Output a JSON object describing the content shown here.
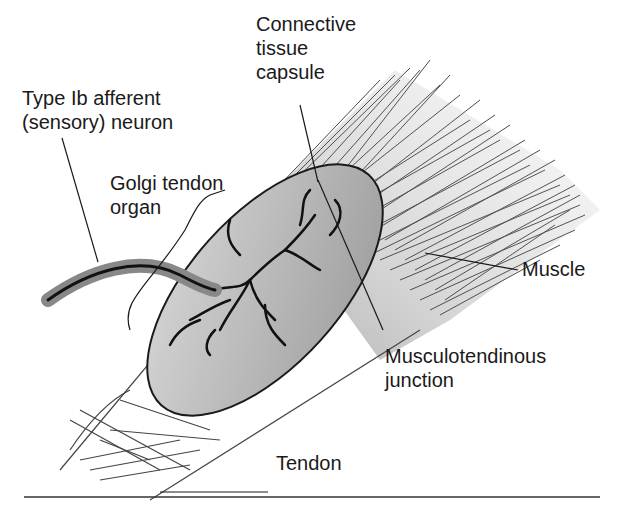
{
  "diagram": {
    "labels": {
      "connective_tissue_capsule": [
        "Connective",
        "tissue",
        "capsule"
      ],
      "type_ib_afferent": [
        "Type Ib afferent",
        "(sensory) neuron"
      ],
      "golgi_tendon_organ": [
        "Golgi tendon",
        "organ"
      ],
      "muscle": "Muscle",
      "musculotendinous_junction": [
        "Musculotendinous",
        "junction"
      ],
      "tendon": "Tendon"
    },
    "colors": {
      "ink": "#1a1a1a",
      "capsule_fill": "#bdbdbd",
      "background": "#ffffff"
    }
  }
}
